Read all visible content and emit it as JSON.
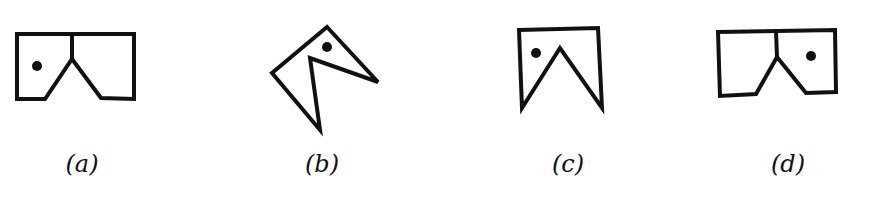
{
  "figure": {
    "stroke_color": "#111111",
    "options": [
      {
        "label": "(a)",
        "label_x": 82,
        "outline": "17,34 134,34 134,99 101,98 72,59 45,99 17,99",
        "divider": {
          "x1": 72,
          "y1": 34,
          "x2": 72,
          "y2": 59
        },
        "dot": {
          "cx": 37,
          "cy": 66
        }
      },
      {
        "label": "(b)",
        "label_x": 322,
        "outline": "327,27 378,82 310,58 320,130 272,73",
        "divider": null,
        "dot": {
          "cx": 327,
          "cy": 47
        }
      },
      {
        "label": "(c)",
        "label_x": 568,
        "outline": "519,30 598,28 602,108 560,48 522,108",
        "divider": null,
        "dot": {
          "cx": 536,
          "cy": 53
        }
      },
      {
        "label": "(d)",
        "label_x": 788,
        "outline": "718,32 835,30 836,92 806,93 777,57 756,94 720,96",
        "divider": {
          "x1": 776,
          "y1": 31,
          "x2": 777,
          "y2": 57
        },
        "dot": {
          "cx": 811,
          "cy": 56
        }
      }
    ]
  }
}
